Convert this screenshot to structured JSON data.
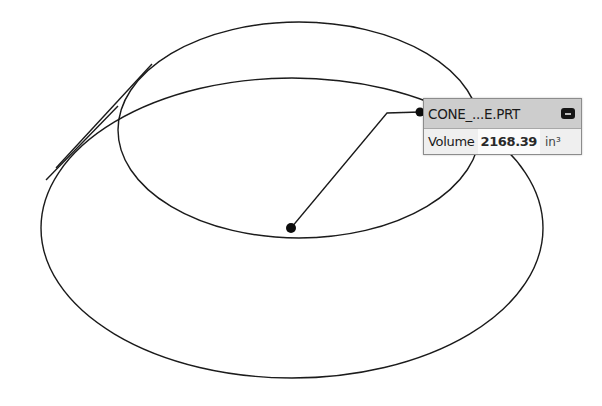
{
  "viewport": {
    "background": "#ffffff",
    "line_color": "#1a1a1a"
  },
  "geometry": {
    "top_ellipse": {
      "cx": 299,
      "cy": 130,
      "rx": 181,
      "ry": 108
    },
    "base_ellipse": {
      "cx": 292,
      "cy": 228,
      "rx": 251,
      "ry": 150
    },
    "silhouette_lines": [
      {
        "x1": 150,
        "y1": 67,
        "x2": 58,
        "y2": 165
      },
      {
        "x1": 122,
        "y1": 105,
        "x2": 48,
        "y2": 178
      }
    ]
  },
  "measurement": {
    "pick_point": {
      "x": 291,
      "y": 228
    },
    "anchor_point": {
      "x": 420,
      "y": 112
    },
    "elbow_point": {
      "x": 387,
      "y": 113
    },
    "callout": {
      "title": "CONE_...E.PRT",
      "collapse_icon": "minus-icon",
      "property_label": "Volume",
      "property_value": "2168.39",
      "property_unit": "in³"
    }
  }
}
